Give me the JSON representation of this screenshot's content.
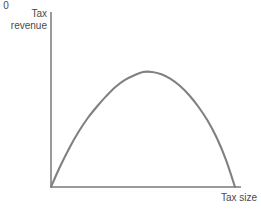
{
  "chart_data": {
    "type": "line",
    "title": "",
    "subtitle": "",
    "xlabel": "Tax size",
    "ylabel": "Tax revenue",
    "ylabel_line1": "Tax",
    "ylabel_line2": "revenue",
    "origin_label": "0",
    "grid": false,
    "legend": false,
    "legend_position": "none",
    "xlim": [
      0,
      1
    ],
    "ylim": [
      0,
      1
    ],
    "x_tick_labels": [],
    "y_tick_labels": [],
    "annotations": [],
    "series": [
      {
        "name": "Laffer curve",
        "color": "#808080",
        "x": [
          0.0,
          0.05,
          0.1,
          0.15,
          0.2,
          0.25,
          0.3,
          0.35,
          0.4,
          0.45,
          0.5,
          0.55,
          0.6,
          0.65,
          0.7,
          0.75,
          0.8,
          0.85,
          0.9,
          0.95,
          1.0
        ],
        "y": [
          0.0,
          0.18,
          0.34,
          0.48,
          0.6,
          0.7,
          0.79,
          0.87,
          0.93,
          0.97,
          1.0,
          1.0,
          0.98,
          0.94,
          0.88,
          0.8,
          0.7,
          0.58,
          0.43,
          0.24,
          0.0
        ],
        "peak_x": 0.53,
        "peak_y": 1.0
      }
    ]
  },
  "colors": {
    "curve": "#808080",
    "axis": "#9a9a9a",
    "text": "#4a4a4a",
    "background": "#ffffff"
  }
}
